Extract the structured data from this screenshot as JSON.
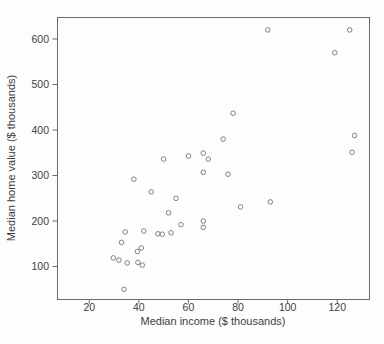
{
  "figure": {
    "type_name": "scatter-plot"
  },
  "chart_data": {
    "type": "scatter",
    "title": "",
    "xlabel": "Median income ($ thousands)",
    "ylabel": "Median home value ($ thousands)",
    "xlim": [
      7,
      132.8
    ],
    "ylim": [
      28.6,
      648.4
    ],
    "xticks": [
      20,
      40,
      60,
      80,
      100,
      120
    ],
    "yticks": [
      100,
      200,
      300,
      400,
      500,
      600
    ],
    "grid": false,
    "legend": "none",
    "marker": "open-circle",
    "n_points": 36,
    "points": [
      [
        29.7,
        119
      ],
      [
        32,
        114
      ],
      [
        33,
        153
      ],
      [
        34,
        50
      ],
      [
        34.5,
        176
      ],
      [
        35.3,
        108
      ],
      [
        38,
        292
      ],
      [
        39.4,
        133
      ],
      [
        39.6,
        109
      ],
      [
        41,
        141
      ],
      [
        41.4,
        103
      ],
      [
        42,
        178
      ],
      [
        45,
        264
      ],
      [
        47.7,
        172
      ],
      [
        49.4,
        171
      ],
      [
        50,
        336
      ],
      [
        52,
        218
      ],
      [
        53,
        174
      ],
      [
        55,
        250
      ],
      [
        57,
        192
      ],
      [
        60,
        343
      ],
      [
        66,
        186
      ],
      [
        66,
        200
      ],
      [
        66,
        307
      ],
      [
        66,
        349
      ],
      [
        68,
        336
      ],
      [
        74,
        380
      ],
      [
        76,
        303
      ],
      [
        78,
        437
      ],
      [
        81,
        231
      ],
      [
        92,
        620
      ],
      [
        93,
        242
      ],
      [
        119,
        570
      ],
      [
        125,
        620
      ],
      [
        126,
        351
      ],
      [
        127,
        388
      ]
    ],
    "colors": {
      "frame": "#6a6a6a",
      "tick": "#6a6a6a",
      "text": "#3d3d3d",
      "marker": "#757575",
      "background": "#fdfdfd"
    }
  }
}
